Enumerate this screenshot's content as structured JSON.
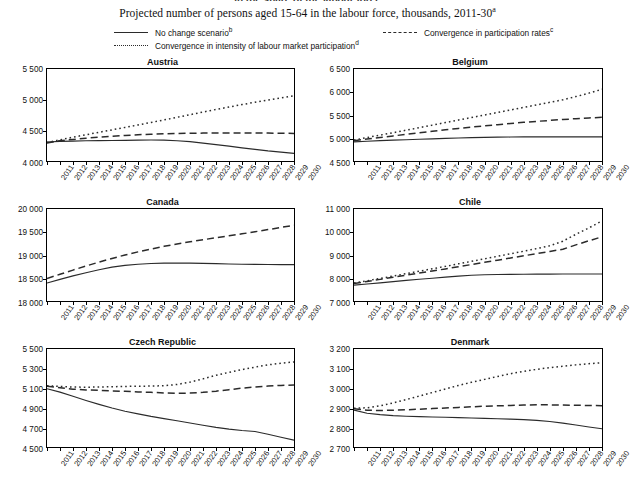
{
  "header": {
    "clipped_heading": "in the share of the labour force",
    "subtitle": "Projected number of persons aged 15-64 in the labour force, thousands, 2011-30",
    "subtitle_note": "a"
  },
  "legend": {
    "items": [
      {
        "style": "solid",
        "label": "No change scenario",
        "note": "b",
        "name": "legend-no-change-scenario"
      },
      {
        "style": "dashed",
        "label": "Convergence in participation rates",
        "note": "c",
        "name": "legend-convergence-participation-rates"
      },
      {
        "style": "dotted",
        "label": "Convergence in intensity of labour market participation",
        "note": "d",
        "name": "legend-convergence-intensity"
      }
    ]
  },
  "chart_data": [
    {
      "type": "line",
      "title": "Austria",
      "xlabel": "",
      "ylabel": "",
      "grid": false,
      "legend_position": "top-shared",
      "x": [
        2011,
        2012,
        2013,
        2014,
        2015,
        2016,
        2017,
        2018,
        2019,
        2020,
        2021,
        2022,
        2023,
        2024,
        2025,
        2026,
        2027,
        2028,
        2029,
        2030
      ],
      "xticks": [
        "2011",
        "2012",
        "2013",
        "2014",
        "2015",
        "2016",
        "2017",
        "2018",
        "2019",
        "2020",
        "2021",
        "2022",
        "2023",
        "2024",
        "2025",
        "2026",
        "2027",
        "2028",
        "2029",
        "2030"
      ],
      "ylim": [
        4000,
        5500
      ],
      "yticks": [
        4000,
        4500,
        5000,
        5500
      ],
      "yticklabels": [
        "4 000",
        "4 500",
        "5 000",
        "5 500"
      ],
      "series": [
        {
          "name": "No change scenario",
          "style": "solid",
          "values": [
            4310,
            4320,
            4325,
            4330,
            4332,
            4335,
            4337,
            4340,
            4342,
            4340,
            4330,
            4315,
            4292,
            4268,
            4242,
            4215,
            4190,
            4165,
            4145,
            4125
          ]
        },
        {
          "name": "Convergence in participation rates",
          "style": "dashed",
          "values": [
            4295,
            4330,
            4352,
            4372,
            4390,
            4404,
            4417,
            4428,
            4437,
            4443,
            4448,
            4452,
            4455,
            4456,
            4457,
            4457,
            4456,
            4455,
            4453,
            4450
          ]
        },
        {
          "name": "Convergence in intensity of labour market participation",
          "style": "dotted",
          "values": [
            4300,
            4345,
            4388,
            4428,
            4468,
            4508,
            4548,
            4588,
            4628,
            4670,
            4712,
            4755,
            4798,
            4840,
            4880,
            4920,
            4958,
            4995,
            5030,
            5062
          ]
        }
      ]
    },
    {
      "type": "line",
      "title": "Belgium",
      "xlabel": "",
      "ylabel": "",
      "grid": false,
      "legend_position": "top-shared",
      "x": [
        2011,
        2012,
        2013,
        2014,
        2015,
        2016,
        2017,
        2018,
        2019,
        2020,
        2021,
        2022,
        2023,
        2024,
        2025,
        2026,
        2027,
        2028,
        2029,
        2030
      ],
      "xticks": [
        "2011",
        "2012",
        "2013",
        "2014",
        "2015",
        "2016",
        "2017",
        "2018",
        "2019",
        "2020",
        "2021",
        "2022",
        "2023",
        "2024",
        "2025",
        "2026",
        "2027",
        "2028",
        "2029",
        "2030"
      ],
      "ylim": [
        4500,
        6500
      ],
      "yticks": [
        4500,
        5000,
        5500,
        6000,
        6500
      ],
      "yticklabels": [
        "4 500",
        "5 000",
        "5 500",
        "6 000",
        "6 500"
      ],
      "series": [
        {
          "name": "No change scenario",
          "style": "solid",
          "values": [
            4915,
            4930,
            4942,
            4953,
            4963,
            4972,
            4982,
            4992,
            5000,
            5008,
            5014,
            5018,
            5021,
            5023,
            5024,
            5025,
            5025,
            5025,
            5025,
            5024
          ]
        },
        {
          "name": "Convergence in participation rates",
          "style": "dashed",
          "values": [
            4940,
            4978,
            5012,
            5045,
            5080,
            5112,
            5145,
            5178,
            5208,
            5238,
            5265,
            5290,
            5315,
            5340,
            5362,
            5382,
            5402,
            5420,
            5436,
            5450
          ]
        },
        {
          "name": "Convergence in intensity of labour market participation",
          "style": "dotted",
          "values": [
            4955,
            5010,
            5063,
            5115,
            5170,
            5225,
            5280,
            5335,
            5390,
            5445,
            5500,
            5555,
            5610,
            5665,
            5720,
            5775,
            5830,
            5900,
            5975,
            6060
          ]
        }
      ]
    },
    {
      "type": "line",
      "title": "Canada",
      "xlabel": "",
      "ylabel": "",
      "grid": false,
      "legend_position": "top-shared",
      "x": [
        2011,
        2012,
        2013,
        2014,
        2015,
        2016,
        2017,
        2018,
        2019,
        2020,
        2021,
        2022,
        2023,
        2024,
        2025,
        2026,
        2027,
        2028,
        2029,
        2030
      ],
      "xticks": [
        "2011",
        "2012",
        "2013",
        "2014",
        "2015",
        "2016",
        "2017",
        "2018",
        "2019",
        "2020",
        "2021",
        "2022",
        "2023",
        "2024",
        "2025",
        "2026",
        "2027",
        "2028",
        "2029",
        "2030"
      ],
      "ylim": [
        18000,
        20000
      ],
      "yticks": [
        18000,
        18500,
        19000,
        19500,
        20000
      ],
      "yticklabels": [
        "18 000",
        "18 500",
        "19 000",
        "19 500",
        "20 000"
      ],
      "series": [
        {
          "name": "No change scenario",
          "style": "solid",
          "values": [
            18390,
            18470,
            18545,
            18615,
            18680,
            18735,
            18775,
            18800,
            18815,
            18822,
            18825,
            18823,
            18818,
            18812,
            18805,
            18800,
            18796,
            18793,
            18792,
            18792
          ]
        },
        {
          "name": "Convergence in participation rates",
          "style": "dashed",
          "values": [
            18490,
            18580,
            18672,
            18760,
            18845,
            18925,
            19000,
            19068,
            19130,
            19188,
            19240,
            19288,
            19332,
            19375,
            19418,
            19460,
            19505,
            19552,
            19600,
            19645
          ]
        }
      ]
    },
    {
      "type": "line",
      "title": "Chile",
      "xlabel": "",
      "ylabel": "",
      "grid": false,
      "legend_position": "top-shared",
      "x": [
        2011,
        2012,
        2013,
        2014,
        2015,
        2016,
        2017,
        2018,
        2019,
        2020,
        2021,
        2022,
        2023,
        2024,
        2025,
        2026,
        2027,
        2028,
        2029,
        2030
      ],
      "xticks": [
        "2011",
        "2012",
        "2013",
        "2014",
        "2015",
        "2016",
        "2017",
        "2018",
        "2019",
        "2020",
        "2021",
        "2022",
        "2023",
        "2024",
        "2025",
        "2026",
        "2027",
        "2028",
        "2029",
        "2030"
      ],
      "ylim": [
        7000,
        11000
      ],
      "yticks": [
        7000,
        8000,
        9000,
        10000,
        11000
      ],
      "yticklabels": [
        "7 000",
        "8 000",
        "9 000",
        "10 000",
        "11 000"
      ],
      "series": [
        {
          "name": "No change scenario",
          "style": "solid",
          "values": [
            7690,
            7740,
            7790,
            7845,
            7895,
            7945,
            7990,
            8035,
            8080,
            8120,
            8140,
            8152,
            8160,
            8165,
            8168,
            8170,
            8172,
            8173,
            8174,
            8175
          ]
        },
        {
          "name": "Convergence in participation rates",
          "style": "dashed",
          "values": [
            7760,
            7850,
            7940,
            8035,
            8125,
            8215,
            8305,
            8395,
            8490,
            8585,
            8680,
            8775,
            8870,
            8965,
            9060,
            9155,
            9250,
            9440,
            9620,
            9790
          ]
        },
        {
          "name": "Convergence in intensity of labour market participation",
          "style": "dotted",
          "values": [
            7780,
            7880,
            7980,
            8085,
            8190,
            8295,
            8400,
            8505,
            8615,
            8725,
            8835,
            8945,
            9055,
            9165,
            9280,
            9400,
            9600,
            9900,
            10180,
            10480
          ]
        }
      ]
    },
    {
      "type": "line",
      "title": "Czech Republic",
      "xlabel": "",
      "ylabel": "",
      "grid": false,
      "legend_position": "top-shared",
      "x": [
        2011,
        2012,
        2013,
        2014,
        2015,
        2016,
        2017,
        2018,
        2019,
        2020,
        2021,
        2022,
        2023,
        2024,
        2025,
        2026,
        2027,
        2028,
        2029,
        2030
      ],
      "xticks": [
        "2011",
        "2012",
        "2013",
        "2014",
        "2015",
        "2016",
        "2017",
        "2018",
        "2019",
        "2020",
        "2021",
        "2022",
        "2023",
        "2024",
        "2025",
        "2026",
        "2027",
        "2028",
        "2029",
        "2030"
      ],
      "ylim": [
        4500,
        5500
      ],
      "yticks": [
        4500,
        4700,
        4900,
        5100,
        5300,
        5500
      ],
      "yticklabels": [
        "4 500",
        "4 700",
        "4 900",
        "5 100",
        "5 300",
        "5 500"
      ],
      "series": [
        {
          "name": "No change scenario",
          "style": "solid",
          "values": [
            5095,
            5060,
            5018,
            4975,
            4935,
            4898,
            4865,
            4838,
            4812,
            4790,
            4768,
            4745,
            4722,
            4700,
            4682,
            4668,
            4658,
            4630,
            4600,
            4570
          ]
        },
        {
          "name": "Convergence in participation rates",
          "style": "dashed",
          "values": [
            5120,
            5105,
            5090,
            5082,
            5078,
            5072,
            5068,
            5062,
            5058,
            5052,
            5048,
            5050,
            5058,
            5070,
            5085,
            5100,
            5112,
            5122,
            5128,
            5132
          ]
        },
        {
          "name": "Convergence in intensity of labour market participation",
          "style": "dotted",
          "values": [
            5125,
            5118,
            5112,
            5110,
            5112,
            5115,
            5118,
            5120,
            5122,
            5125,
            5138,
            5162,
            5195,
            5232,
            5262,
            5290,
            5315,
            5338,
            5355,
            5368
          ]
        }
      ]
    },
    {
      "type": "line",
      "title": "Denmark",
      "xlabel": "",
      "ylabel": "",
      "grid": false,
      "legend_position": "top-shared",
      "x": [
        2011,
        2012,
        2013,
        2014,
        2015,
        2016,
        2017,
        2018,
        2019,
        2020,
        2021,
        2022,
        2023,
        2024,
        2025,
        2026,
        2027,
        2028,
        2029,
        2030
      ],
      "xticks": [
        "2011",
        "2012",
        "2013",
        "2014",
        "2015",
        "2016",
        "2017",
        "2018",
        "2019",
        "2020",
        "2021",
        "2022",
        "2023",
        "2024",
        "2025",
        "2026",
        "2027",
        "2028",
        "2029",
        "2030"
      ],
      "ylim": [
        2700,
        3200
      ],
      "yticks": [
        2700,
        2800,
        2900,
        3000,
        3100,
        3200
      ],
      "yticklabels": [
        "2 700",
        "2 800",
        "2 900",
        "3 000",
        "3 100",
        "3 200"
      ],
      "series": [
        {
          "name": "No change scenario",
          "style": "solid",
          "values": [
            2888,
            2872,
            2865,
            2860,
            2857,
            2855,
            2853,
            2852,
            2850,
            2848,
            2846,
            2844,
            2842,
            2840,
            2836,
            2830,
            2822,
            2812,
            2802,
            2793
          ]
        },
        {
          "name": "Convergence in participation rates",
          "style": "dashed",
          "values": [
            2895,
            2888,
            2886,
            2888,
            2890,
            2893,
            2896,
            2899,
            2902,
            2905,
            2908,
            2910,
            2912,
            2914,
            2915,
            2915,
            2914,
            2913,
            2912,
            2911
          ]
        },
        {
          "name": "Convergence in intensity of labour market participation",
          "style": "dotted",
          "values": [
            2898,
            2900,
            2910,
            2925,
            2942,
            2960,
            2978,
            2996,
            3014,
            3030,
            3045,
            3060,
            3074,
            3086,
            3096,
            3105,
            3112,
            3119,
            3125,
            3130
          ]
        }
      ]
    }
  ]
}
